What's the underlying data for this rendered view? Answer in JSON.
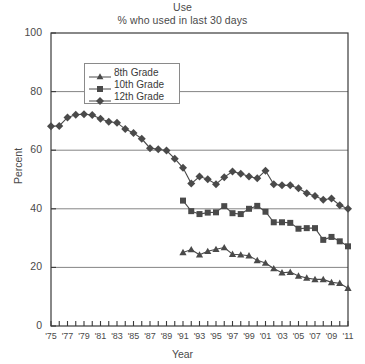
{
  "chart_data": {
    "type": "line",
    "title": "Use",
    "subtitle": "% who used in last 30 days",
    "xlabel": "Year",
    "ylabel": "Percent",
    "ylim": [
      0,
      100
    ],
    "yticks": [
      0,
      20,
      40,
      60,
      80,
      100
    ],
    "xlim": [
      1975,
      2011
    ],
    "grid": "horizontal",
    "legend_position": "upper-left-inside",
    "xtick_labels": [
      "'75",
      "'77",
      "'79",
      "'81",
      "'83",
      "'85",
      "'87",
      "'89",
      "'91",
      "'93",
      "'95",
      "'97",
      "'99",
      "'01",
      "'03",
      "'05",
      "'07",
      "'09",
      "'11"
    ],
    "xtick_years": [
      1975,
      1977,
      1979,
      1981,
      1983,
      1985,
      1987,
      1989,
      1991,
      1993,
      1995,
      1997,
      1999,
      2001,
      2003,
      2005,
      2007,
      2009,
      2011
    ],
    "series": [
      {
        "name": "8th Grade",
        "marker": "triangle",
        "color": "#4a4a4a",
        "x": [
          1991,
          1992,
          1993,
          1994,
          1995,
          1996,
          1997,
          1998,
          1999,
          2000,
          2001,
          2002,
          2003,
          2004,
          2005,
          2006,
          2007,
          2008,
          2009,
          2010,
          2011
        ],
        "values": [
          25.1,
          26.1,
          24.3,
          25.5,
          26.2,
          26.8,
          24.5,
          24.3,
          24.0,
          22.4,
          21.5,
          19.6,
          18.2,
          18.4,
          17.1,
          16.4,
          15.9,
          15.9,
          14.9,
          14.6,
          12.9
        ]
      },
      {
        "name": "10th Grade",
        "marker": "square",
        "color": "#4a4a4a",
        "x": [
          1991,
          1992,
          1993,
          1994,
          1995,
          1996,
          1997,
          1998,
          1999,
          2000,
          2001,
          2002,
          2003,
          2004,
          2005,
          2006,
          2007,
          2008,
          2009,
          2010,
          2011
        ],
        "values": [
          42.8,
          39.2,
          38.2,
          38.7,
          38.8,
          40.9,
          38.5,
          38.2,
          40.0,
          41.0,
          39.0,
          35.4,
          35.4,
          35.2,
          33.2,
          33.4,
          33.4,
          29.4,
          30.4,
          28.9,
          27.2
        ]
      },
      {
        "name": "12th Grade",
        "marker": "diamond",
        "color": "#4a4a4a",
        "x": [
          1975,
          1976,
          1977,
          1978,
          1979,
          1980,
          1981,
          1982,
          1983,
          1984,
          1985,
          1986,
          1987,
          1988,
          1989,
          1990,
          1991,
          1992,
          1993,
          1994,
          1995,
          1996,
          1997,
          1998,
          1999,
          2000,
          2001,
          2002,
          2003,
          2004,
          2005,
          2006,
          2007,
          2008,
          2009,
          2010,
          2011
        ],
        "values": [
          68.2,
          68.3,
          71.2,
          72.1,
          72.3,
          72.0,
          70.7,
          69.7,
          69.4,
          67.2,
          65.9,
          63.9,
          60.7,
          60.3,
          59.9,
          57.1,
          54.0,
          48.6,
          51.0,
          50.1,
          48.4,
          50.8,
          52.7,
          52.0,
          51.0,
          50.4,
          53.0,
          48.4,
          48.0,
          48.0,
          47.0,
          45.3,
          44.4,
          43.1,
          43.5,
          41.2,
          40.0
        ]
      }
    ]
  }
}
